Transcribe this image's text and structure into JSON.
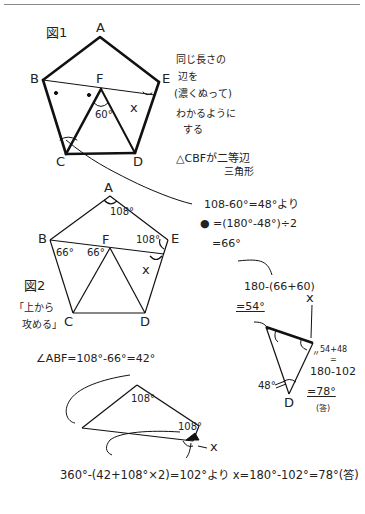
{
  "figure1": {
    "title": "図1",
    "vertices": {
      "A": "A",
      "B": "B",
      "C": "C",
      "D": "D",
      "E": "E",
      "F": "F"
    },
    "angle_F": "60°",
    "angle_x": "x",
    "note_lines": [
      "同じ長さの",
      "辺を",
      "(濃くぬって)",
      "わかるように",
      "する"
    ],
    "isosceles_note": [
      "△CBFが二等辺",
      "三角形"
    ]
  },
  "calc1": {
    "line1": "108-60°=48°より",
    "line2": "● =(180°-48°)÷2",
    "line3": "=66°"
  },
  "figure2": {
    "title": "図2",
    "approach": [
      "「上から",
      "攻める」"
    ],
    "vertices": {
      "A": "A",
      "B": "B",
      "C": "C",
      "D": "D",
      "E": "E",
      "F": "F"
    },
    "angle_A": "108°",
    "angle_E": "108°",
    "angle_B": "66°",
    "angle_F": "66°",
    "angle_x": "x"
  },
  "calc2": {
    "line1": "180-(66+60)",
    "line2": "=54°"
  },
  "small_triangle": {
    "x_label": "x",
    "angle_D": "48°",
    "label_D": "D",
    "sum_note": "54+48",
    "eq_mark": "=",
    "line1": "180-102",
    "line2": "=78°",
    "answer": "(答)",
    "ellipsis": "〃"
  },
  "angle_abf": "∠ABF=108°-66°=42°",
  "quad": {
    "angle_top": "108°",
    "angle_right": "108°",
    "x_label": "x"
  },
  "final": "360°-(42+108°×2)=102°より x=180°-102°=78°(答)"
}
